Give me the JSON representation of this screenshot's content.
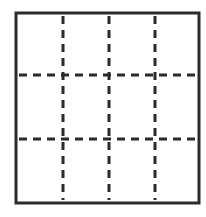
{
  "diagram": {
    "type": "grid",
    "rows": 3,
    "columns": 4,
    "border": {
      "x": 16,
      "y": 13,
      "width": 183,
      "height": 190,
      "stroke": "#2b2b2b",
      "stroke_width": 3
    },
    "dashed_lines": {
      "stroke": "#2b2b2b",
      "stroke_width": 3,
      "dash": "8 6",
      "vertical_x": [
        63,
        109,
        155
      ],
      "horizontal_y": [
        75,
        139
      ]
    }
  }
}
